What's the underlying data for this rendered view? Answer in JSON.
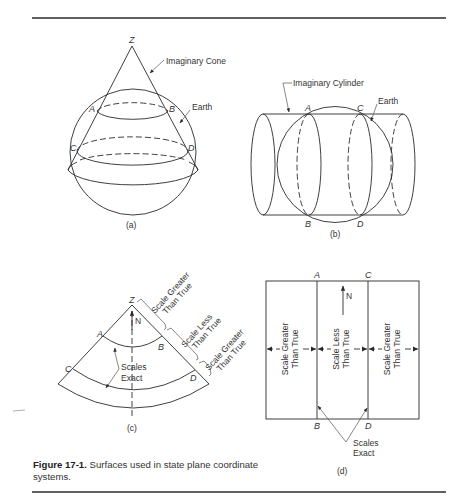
{
  "figure": {
    "number": "Figure 17-1.",
    "caption": "Surfaces used in state plane coordinate systems."
  },
  "panel_a": {
    "sublabel": "(a)",
    "apex": "Z",
    "points": [
      "A",
      "B",
      "C",
      "D"
    ],
    "cone_label": "Imaginary Cone",
    "earth_label": "Earth"
  },
  "panel_b": {
    "sublabel": "(b)",
    "points": [
      "A",
      "C",
      "B",
      "D"
    ],
    "cylinder_label": "Imaginary Cylinder",
    "earth_label": "Earth"
  },
  "panel_c": {
    "sublabel": "(c)",
    "apex": "Z",
    "north": "N",
    "points": [
      "A",
      "B",
      "C",
      "D"
    ],
    "zones": [
      {
        "line1": "Scale Greater",
        "line2": "Than True"
      },
      {
        "line1": "Scale Less",
        "line2": "Than True"
      },
      {
        "line1": "Scale Greater",
        "line2": "Than True"
      }
    ],
    "exact_line1": "Scales",
    "exact_line2": "Exact"
  },
  "panel_d": {
    "sublabel": "(d)",
    "north": "N",
    "points": [
      "A",
      "C",
      "B",
      "D"
    ],
    "zones": [
      {
        "line1": "Scale Greater",
        "line2": "Than True"
      },
      {
        "line1": "Scale Less",
        "line2": "Than True"
      },
      {
        "line1": "Scale Greater",
        "line2": "Than True"
      }
    ],
    "exact_line1": "Scales",
    "exact_line2": "Exact"
  }
}
